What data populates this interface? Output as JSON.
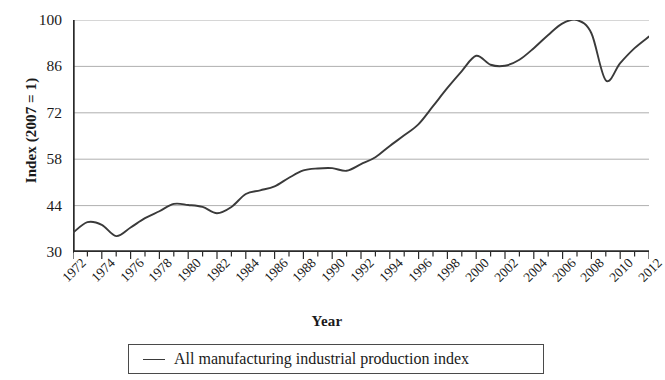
{
  "chart_data": {
    "type": "line",
    "title": "",
    "xlabel": "Year",
    "ylabel": "Index (2007 = 1)",
    "xlim": [
      1972,
      2012
    ],
    "ylim": [
      30,
      100
    ],
    "yticks": [
      30,
      44,
      58,
      72,
      86,
      100
    ],
    "xticks": [
      1972,
      1974,
      1976,
      1978,
      1980,
      1982,
      1984,
      1986,
      1988,
      1990,
      1992,
      1994,
      1996,
      1998,
      2000,
      2002,
      2004,
      2006,
      2008,
      2010,
      2012
    ],
    "xticks_minor_step": 1,
    "grid": "horizontal",
    "legend_position": "bottom",
    "line_color": "#3a3a3a",
    "grid_color": "#9a9a9a",
    "axis_color": "#2a2a2a",
    "series": [
      {
        "name": "All manufacturing industrial production index",
        "x": [
          1972,
          1973,
          1974,
          1975,
          1976,
          1977,
          1978,
          1979,
          1980,
          1981,
          1982,
          1983,
          1984,
          1985,
          1986,
          1987,
          1988,
          1989,
          1990,
          1991,
          1992,
          1993,
          1994,
          1995,
          1996,
          1997,
          1998,
          1999,
          2000,
          2001,
          2002,
          2003,
          2004,
          2005,
          2006,
          2007,
          2008,
          2009,
          2010,
          2011,
          2012
        ],
        "values": [
          35.8,
          39.0,
          38.2,
          34.8,
          37.4,
          40.2,
          42.3,
          44.5,
          44.2,
          43.6,
          41.7,
          43.6,
          47.5,
          48.6,
          49.8,
          52.4,
          54.6,
          55.2,
          55.3,
          54.5,
          56.5,
          58.6,
          62.0,
          65.2,
          68.6,
          74.0,
          79.5,
          84.6,
          89.2,
          86.5,
          86.2,
          88.0,
          91.5,
          95.5,
          99.0,
          100.0,
          96.0,
          81.8,
          87.0,
          91.5,
          95.0
        ]
      }
    ]
  },
  "legend": {
    "items": [
      {
        "marker": "line",
        "label": "All manufacturing industrial production index"
      }
    ]
  },
  "axes": {
    "y_title": "Index (2007 = 1)",
    "x_title": "Year",
    "y_tick_labels": [
      "100",
      "86",
      "72",
      "58",
      "44",
      "30"
    ],
    "x_tick_labels": [
      "1972",
      "1974",
      "1976",
      "1978",
      "1980",
      "1982",
      "1984",
      "1986",
      "1988",
      "1990",
      "1992",
      "1994",
      "1996",
      "1998",
      "2000",
      "2002",
      "2004",
      "2006",
      "2008",
      "2010",
      "2012"
    ]
  }
}
